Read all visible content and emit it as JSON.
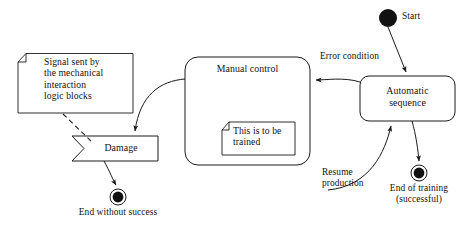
{
  "diagram": {
    "type": "uml-state-machine-diagram",
    "background_color": "#ffffff",
    "line_color": "#1a1a1a",
    "text_color": "#111111"
  },
  "notes": {
    "signal_note": {
      "lines": [
        "Signal sent by",
        "the mechanical",
        "interaction",
        "logic blocks"
      ],
      "text": "Signal sent by\nthe mechanical\ninteraction\nlogic blocks"
    },
    "training_note": {
      "lines": [
        "This is to be",
        "trained"
      ],
      "text": "This is to be\ntrained"
    }
  },
  "states": {
    "manual_control": {
      "label": "Manual control"
    },
    "automatic_sequence": {
      "lines": [
        "Automatic",
        "sequence"
      ],
      "text": "Automatic\nsequence"
    },
    "damage": {
      "label": "Damage"
    }
  },
  "nodes": {
    "start": {
      "label": "Start"
    },
    "end_without_success": {
      "label": "End without success"
    },
    "end_of_training": {
      "lines": [
        "End of training",
        "(successful)"
      ],
      "text": "End of training\n(successful)"
    }
  },
  "transitions": {
    "error_condition": {
      "label": "Error condition"
    },
    "resume_production": {
      "lines": [
        "Resume",
        "production"
      ],
      "text": "Resume\nproduction"
    }
  }
}
